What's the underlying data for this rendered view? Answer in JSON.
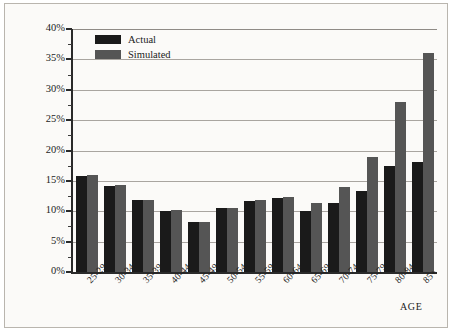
{
  "chart_data": {
    "type": "bar",
    "title": "",
    "xlabel": "AGE",
    "ylabel": "",
    "ylim": [
      0,
      40
    ],
    "ytick_step": 5,
    "yminor_step": 2.5,
    "grid": true,
    "legend_position": "top-left inside plot",
    "ytick_labels": [
      "0%",
      "5%",
      "10%",
      "15%",
      "20%",
      "25%",
      "30%",
      "35%",
      "40%"
    ],
    "ytick_values": [
      0,
      5,
      10,
      15,
      20,
      25,
      30,
      35,
      40
    ],
    "categories": [
      "25-29",
      "30-34",
      "35-39",
      "40-44",
      "45-49",
      "50-54",
      "55-59",
      "60-64",
      "65-69",
      "70-74",
      "75-79",
      "80-84",
      "85+"
    ],
    "series": [
      {
        "name": "Actual",
        "color": "#1a1a1a",
        "values": [
          15.8,
          14.2,
          11.8,
          10.1,
          8.2,
          10.5,
          11.7,
          12.2,
          10.1,
          11.3,
          13.3,
          17.5,
          18.1
        ]
      },
      {
        "name": "Simulated",
        "color": "#555555",
        "values": [
          16.0,
          14.3,
          11.9,
          10.2,
          8.3,
          10.6,
          11.8,
          12.3,
          11.3,
          14.0,
          19.0,
          28.0,
          36.1
        ]
      }
    ]
  },
  "legend": {
    "items": [
      {
        "label": "Actual",
        "swatch": "actual-swatch"
      },
      {
        "label": "Simulated",
        "swatch": "simulated-swatch"
      }
    ]
  },
  "axis": {
    "x_title": "AGE"
  }
}
